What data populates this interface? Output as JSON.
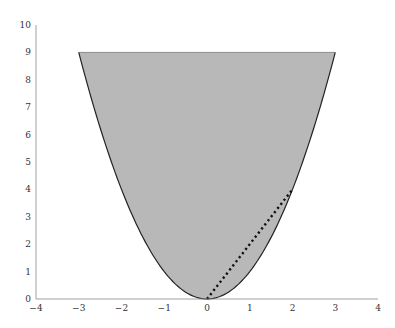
{
  "chart_data": {
    "type": "area",
    "title": "",
    "xlabel": "",
    "ylabel": "",
    "xlim": [
      -4,
      4
    ],
    "ylim": [
      0,
      10
    ],
    "grid": false,
    "legend": null,
    "x_ticks": [
      "−4",
      "−3",
      "−2",
      "−1",
      "0",
      "1",
      "2",
      "3",
      "4"
    ],
    "y_ticks": [
      "0",
      "1",
      "2",
      "3",
      "4",
      "5",
      "6",
      "7",
      "8",
      "9",
      "10"
    ],
    "series": [
      {
        "name": "region y >= x^2, y <= 9",
        "kind": "filled-region",
        "function": "y = x^2",
        "x_range": [
          -3,
          3
        ],
        "upper_bound": 9,
        "fill": "#b8b8b8",
        "edge": "#222222"
      },
      {
        "name": "dotted segment",
        "kind": "line",
        "style": "dotted",
        "color": "#111111",
        "points": [
          [
            0,
            0
          ],
          [
            2,
            4
          ]
        ]
      }
    ]
  }
}
